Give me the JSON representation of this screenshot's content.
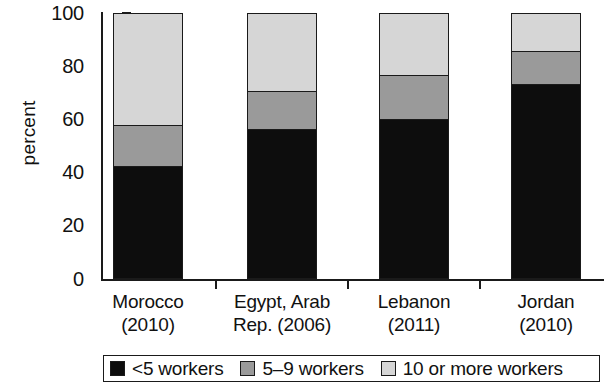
{
  "chart_data": {
    "type": "bar",
    "stacked": true,
    "title": "",
    "subtitle": "",
    "xlabel": "",
    "ylabel": "percent",
    "ylim": [
      0,
      100
    ],
    "yticks": [
      0,
      20,
      40,
      60,
      80,
      100
    ],
    "grid": false,
    "legend_position": "bottom",
    "categories": [
      "Morocco (2010)",
      "Egypt, Arab Rep. (2006)",
      "Lebanon (2011)",
      "Jordan (2010)"
    ],
    "category_lines": [
      [
        "Morocco",
        "(2010)"
      ],
      [
        "Egypt, Arab",
        "Rep. (2006)"
      ],
      [
        "Lebanon",
        "(2011)"
      ],
      [
        "Jordan",
        "(2010)"
      ]
    ],
    "series": [
      {
        "name": "<5 workers",
        "color": "#0d0d0d",
        "values": [
          42,
          56,
          60,
          73
        ]
      },
      {
        "name": "5–9 workers",
        "color": "#9a9a9a",
        "values": [
          16,
          15,
          17,
          13
        ]
      },
      {
        "name": "10 or more workers",
        "color": "#d6d6d6",
        "values": [
          42,
          29,
          23,
          14
        ]
      }
    ],
    "cumulative_tops": [
      [
        42,
        58,
        100
      ],
      [
        56,
        71,
        100
      ],
      [
        60,
        77,
        100
      ],
      [
        73,
        86,
        100
      ]
    ]
  },
  "axis": {
    "y_title": "percent",
    "y_tick_labels": [
      "100",
      "80",
      "60",
      "40",
      "20",
      "0"
    ]
  },
  "legend": {
    "items": [
      {
        "label": "<5 workers",
        "swatch": "black-swatch-icon"
      },
      {
        "label": "5–9 workers",
        "swatch": "gray-swatch-icon"
      },
      {
        "label": "10 or more workers",
        "swatch": "light-gray-swatch-icon"
      }
    ]
  },
  "colors": {
    "small": "#0d0d0d",
    "mid": "#9a9a9a",
    "large": "#d6d6d6",
    "axis": "#1a1a1a",
    "background": "#ffffff"
  }
}
